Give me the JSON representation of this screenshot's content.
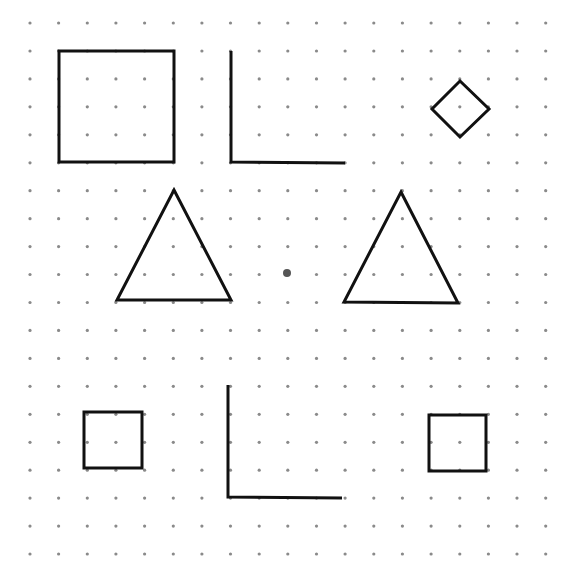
{
  "figure": {
    "width": 576,
    "height": 569,
    "background": "#ffffff",
    "dot_color": "#8a8a8a",
    "dot_radius": 1.6,
    "stroke_color": "#111111",
    "stroke_width": 3,
    "grid": {
      "x0": 30,
      "dx": 28.65,
      "cols": 20,
      "y0": 23,
      "dy": 27.95,
      "rows": 20
    },
    "center_dot": {
      "x": 287,
      "y": 273,
      "r": 4,
      "color": "#555555"
    },
    "shapes": [
      {
        "name": "large-square",
        "type": "polygon",
        "points": [
          [
            59,
            51
          ],
          [
            174,
            51
          ],
          [
            174,
            162
          ],
          [
            59,
            162
          ]
        ]
      },
      {
        "name": "l-shape-top",
        "type": "polyline",
        "points": [
          [
            231,
            51
          ],
          [
            231,
            162
          ],
          [
            345,
            163
          ]
        ]
      },
      {
        "name": "diamond",
        "type": "polygon",
        "points": [
          [
            460,
            81
          ],
          [
            489,
            109
          ],
          [
            460,
            137
          ],
          [
            432,
            109
          ]
        ]
      },
      {
        "name": "triangle-left",
        "type": "polygon",
        "points": [
          [
            174,
            190
          ],
          [
            231,
            300
          ],
          [
            117,
            300
          ]
        ]
      },
      {
        "name": "triangle-right",
        "type": "polygon",
        "points": [
          [
            401,
            192
          ],
          [
            458,
            303
          ],
          [
            344,
            302
          ]
        ]
      },
      {
        "name": "small-square-left",
        "type": "polygon",
        "points": [
          [
            84,
            412
          ],
          [
            142,
            412
          ],
          [
            142,
            468
          ],
          [
            84,
            468
          ]
        ]
      },
      {
        "name": "l-shape-bottom",
        "type": "polyline",
        "points": [
          [
            228,
            385
          ],
          [
            228,
            497
          ],
          [
            342,
            498
          ]
        ]
      },
      {
        "name": "small-square-right",
        "type": "polygon",
        "points": [
          [
            429,
            415
          ],
          [
            486,
            415
          ],
          [
            486,
            471
          ],
          [
            429,
            471
          ]
        ]
      }
    ]
  }
}
